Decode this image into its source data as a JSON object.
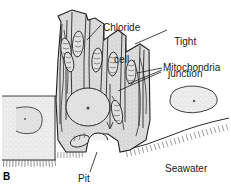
{
  "figure": {
    "panel_letter": "B",
    "type": "biological-line-drawing",
    "background_color": "#ffffff",
    "ink_color": "#1a1a1a",
    "cytoplasm_color": "#d8d8d8"
  },
  "labels": {
    "chloride_cell_line1": "Chloride",
    "chloride_cell_line2": "cell",
    "tight_junction_line1": "Tight",
    "tight_junction_line2": "junction",
    "mitochondria": "Mitochondria",
    "seawater": "Seawater",
    "pit": "Pit"
  },
  "structures": [
    {
      "name": "chloride-cell",
      "label": "Chloride cell"
    },
    {
      "name": "tight-junction",
      "label": "Tight junction"
    },
    {
      "name": "mitochondria",
      "label": "Mitochondria"
    },
    {
      "name": "pit",
      "label": "Pit"
    },
    {
      "name": "seawater",
      "label": "Seawater"
    },
    {
      "name": "nucleus",
      "label": ""
    },
    {
      "name": "neighbouring-cell-left",
      "label": ""
    },
    {
      "name": "neighbouring-cell-right",
      "label": ""
    },
    {
      "name": "basal-membrane-microvilli",
      "label": ""
    }
  ]
}
